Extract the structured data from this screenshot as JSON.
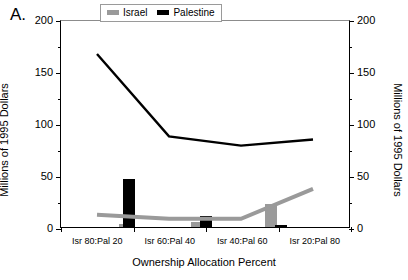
{
  "chart_data": {
    "type": "line",
    "title": "",
    "panel_label": "A.",
    "xlabel": "Ownership Allocation Percent",
    "ylabel": "Millions of 1995 Dollars",
    "ylabel_right": "Millions of 1995 Dollars",
    "categories": [
      "Isr 80:Pal 20",
      "Isr 60:Pal 40",
      "Isr 40:Pal 60",
      "Isr 20:Pal 80"
    ],
    "ylim": [
      0,
      200
    ],
    "yticks": [
      0,
      50,
      100,
      150,
      200
    ],
    "ytick_labels": [
      "0",
      "50",
      "100",
      "150",
      "200"
    ],
    "yticks_minor": [
      25,
      75,
      125,
      175
    ],
    "grid": false,
    "legend_position": "top-center",
    "series": [
      {
        "name": "Israel",
        "kind": "line",
        "color": "#9a9a9a",
        "values": [
          12,
          8,
          8,
          37
        ]
      },
      {
        "name": "Palestine",
        "kind": "line",
        "color": "#000000",
        "values": [
          168,
          88,
          79,
          85
        ]
      }
    ],
    "bars": [
      {
        "series": "Israel",
        "x_position": 0.38,
        "value": 3,
        "color": "#9a9a9a"
      },
      {
        "series": "Palestine",
        "x_position": 0.44,
        "value": 46,
        "color": "#000000"
      },
      {
        "series": "Israel",
        "x_position": 1.38,
        "value": 5,
        "color": "#9a9a9a"
      },
      {
        "series": "Palestine",
        "x_position": 1.5,
        "value": 11,
        "color": "#000000"
      },
      {
        "series": "Israel",
        "x_position": 2.4,
        "value": 22,
        "color": "#9a9a9a"
      },
      {
        "series": "Palestine",
        "x_position": 2.53,
        "value": 2,
        "color": "#000000"
      }
    ]
  },
  "legend": {
    "israel_label": "Israel",
    "palestine_label": "Palestine",
    "israel_color": "#9a9a9a",
    "palestine_color": "#000000"
  },
  "axes": {
    "y_title_left": "Millions of 1995 Dollars",
    "y_title_right": "Millions of 1995 Dollars",
    "x_title": "Ownership Allocation Percent",
    "y_labels": [
      "200",
      "150",
      "100",
      "50",
      "0"
    ],
    "x_labels": [
      "Isr 80:Pal 20",
      "Isr 60:Pal 40",
      "Isr 40:Pal 60",
      "Isr 20:Pal 80"
    ]
  },
  "panel": {
    "label": "A."
  }
}
